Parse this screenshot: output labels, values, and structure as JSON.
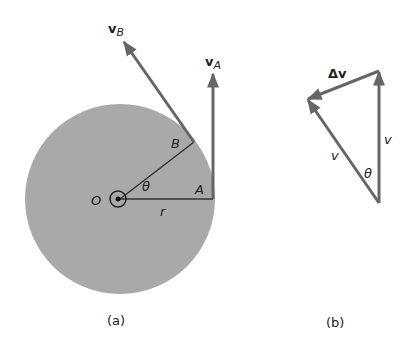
{
  "figure_a": {
    "caption": "(a)",
    "center_label": "O",
    "radius_label": "r",
    "angle_label": "θ",
    "point_a_label": "A",
    "point_b_label": "B",
    "vector_a_label": "v",
    "vector_a_sub": "A",
    "vector_b_label": "v",
    "vector_b_sub": "B",
    "disk_color": "#a9a9a9",
    "line_color": "#555555"
  },
  "figure_b": {
    "caption": "(b)",
    "delta_label": "Δv",
    "side_left_label": "v",
    "side_right_label": "v",
    "angle_label": "θ"
  }
}
